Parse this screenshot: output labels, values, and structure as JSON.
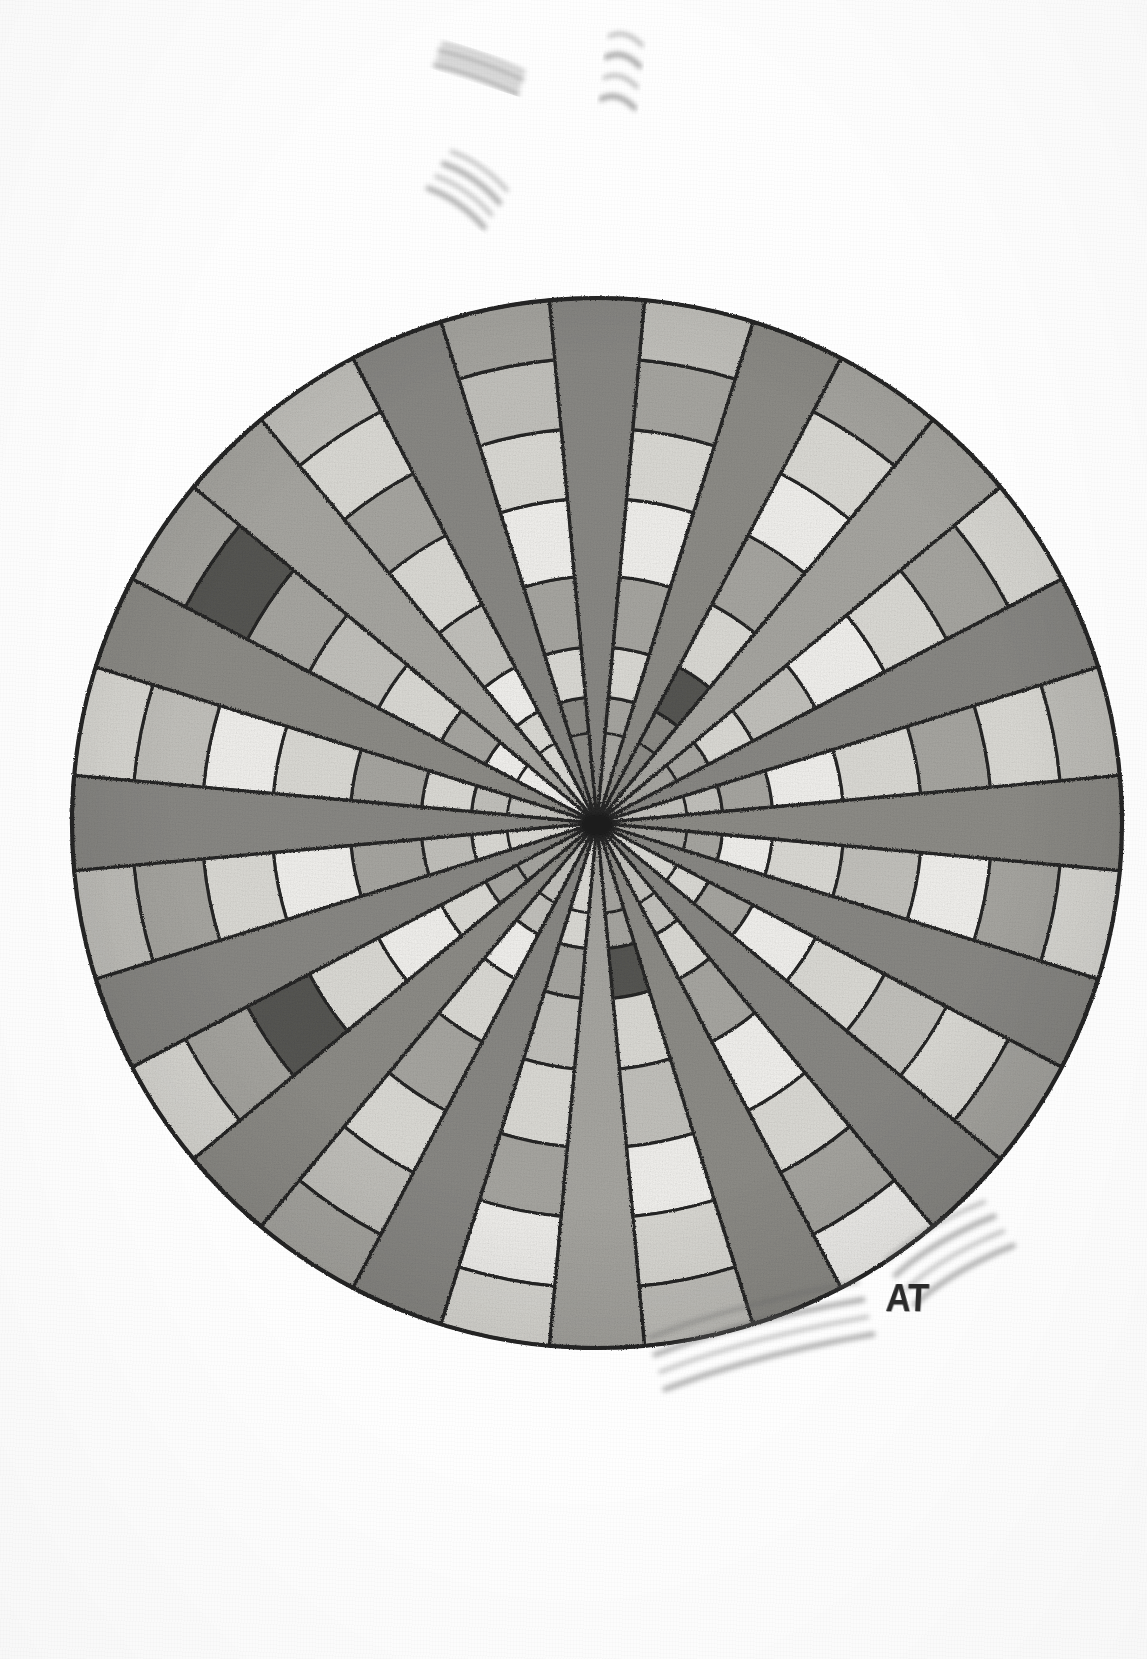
{
  "artwork": {
    "title": "Radial Mandala",
    "medium": "graphite pencil on paper",
    "signature": "AT",
    "background_color": "#fefefe",
    "ink_color": "#262626"
  },
  "chart_data": {
    "type": "pie",
    "xlabel": "",
    "ylabel": "",
    "center": {
      "x": 597,
      "y": 823
    },
    "outer_radius": 525,
    "grid": false,
    "legend_position": "none",
    "rings": [
      {
        "index": 0,
        "inner_r": 0,
        "outer_r": 90
      },
      {
        "index": 1,
        "inner_r": 90,
        "outer_r": 126
      },
      {
        "index": 2,
        "inner_r": 126,
        "outer_r": 176
      },
      {
        "index": 3,
        "inner_r": 176,
        "outer_r": 247
      },
      {
        "index": 4,
        "inner_r": 247,
        "outer_r": 325
      },
      {
        "index": 5,
        "inner_r": 325,
        "outer_r": 395
      },
      {
        "index": 6,
        "inner_r": 395,
        "outer_r": 465
      },
      {
        "index": 7,
        "inner_r": 465,
        "outer_r": 525
      }
    ],
    "spoke_count": 16,
    "spoke_angles_deg": [
      0,
      22.5,
      45,
      67.5,
      90,
      112.5,
      135,
      157.5,
      180,
      202.5,
      225,
      247.5,
      270,
      292.5,
      315,
      337.5
    ],
    "wedge_half_width_deg": 5.2,
    "palette": {
      "white": "#f2f1ee",
      "light": "#dcdbd6",
      "mid_light": "#c3c2bd",
      "mid": "#a8a7a2",
      "mid_dark": "#8e8d88",
      "dark": "#6e6d69",
      "darker": "#575652",
      "spoke": "#8a8985",
      "outline": "#262626"
    },
    "sector_tones": [
      [
        "mid",
        "light",
        "mid",
        "white",
        "light",
        "mid",
        "mid_light"
      ],
      [
        "mid_dark",
        "darker",
        "light",
        "mid",
        "white",
        "light",
        "mid"
      ],
      [
        "mid",
        "light",
        "mid_light",
        "white",
        "light",
        "mid",
        "light"
      ],
      [
        "mid_light",
        "mid",
        "white",
        "light",
        "mid",
        "light",
        "mid_light"
      ],
      [
        "mid",
        "white",
        "light",
        "mid_light",
        "white",
        "mid",
        "light"
      ],
      [
        "light",
        "mid",
        "white",
        "light",
        "mid_light",
        "light",
        "mid"
      ],
      [
        "mid_light",
        "light",
        "mid",
        "white",
        "light",
        "mid",
        "white"
      ],
      [
        "mid",
        "darker",
        "light",
        "mid_light",
        "white",
        "light",
        "mid_light"
      ],
      [
        "light",
        "mid",
        "mid_light",
        "light",
        "mid",
        "white",
        "light"
      ],
      [
        "mid_light",
        "white",
        "light",
        "mid",
        "light",
        "mid_light",
        "mid"
      ],
      [
        "mid",
        "light",
        "white",
        "light",
        "darker",
        "mid",
        "light"
      ],
      [
        "light",
        "mid_light",
        "mid",
        "white",
        "light",
        "mid",
        "mid_light"
      ],
      [
        "mid_light",
        "light",
        "mid",
        "light",
        "white",
        "mid_light",
        "light"
      ],
      [
        "white",
        "mid",
        "light",
        "mid_light",
        "mid",
        "darker",
        "mid"
      ],
      [
        "light",
        "white",
        "mid_light",
        "light",
        "mid",
        "light",
        "mid_light"
      ],
      [
        "mid_dark",
        "light",
        "mid",
        "white",
        "light",
        "mid_light",
        "mid"
      ]
    ],
    "stray_marks": [
      {
        "name": "mark-top-left",
        "x": 438,
        "y": 58,
        "w": 86,
        "h": 30,
        "rot": 18,
        "opacity": 0.55
      },
      {
        "name": "mark-top-center",
        "x": 604,
        "y": 78,
        "w": 34,
        "h": 84,
        "rot": 7,
        "opacity": 0.6
      },
      {
        "name": "mark-upper-left",
        "x": 436,
        "y": 176,
        "w": 68,
        "h": 58,
        "rot": 32,
        "opacity": 0.55
      },
      {
        "name": "mark-bottom-right-1",
        "x": 660,
        "y": 1372,
        "w": 215,
        "h": 72,
        "rot": -16,
        "opacity": 0.55
      },
      {
        "name": "mark-bottom-right-2",
        "x": 905,
        "y": 1290,
        "w": 115,
        "h": 70,
        "rot": -33,
        "opacity": 0.55
      }
    ]
  }
}
